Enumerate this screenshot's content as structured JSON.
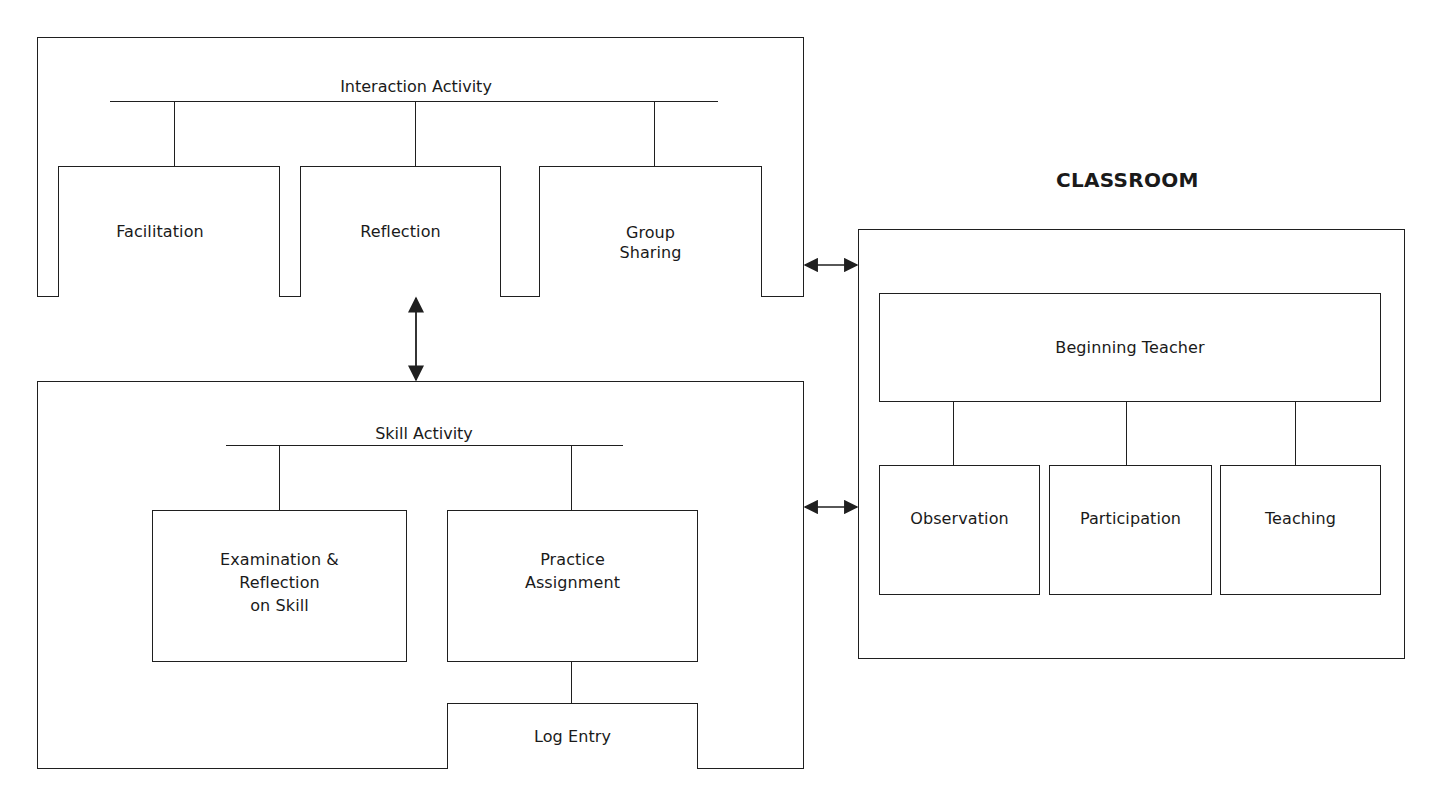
{
  "diagram": {
    "interaction_section": {
      "heading": "Interaction Activity",
      "children": [
        {
          "label": "Facilitation"
        },
        {
          "label": "Reflection"
        },
        {
          "label": "Group\nSharing"
        }
      ]
    },
    "skill_section": {
      "heading": "Skill Activity",
      "children": [
        {
          "label": "Examination &\nReflection\non Skill"
        },
        {
          "label": "Practice\nAssignment"
        }
      ],
      "sub_child": {
        "label": "Log Entry"
      }
    },
    "classroom_section": {
      "title": "CLASSROOM",
      "root": {
        "label": "Beginning Teacher"
      },
      "children": [
        {
          "label": "Observation"
        },
        {
          "label": "Participation"
        },
        {
          "label": "Teaching"
        }
      ]
    },
    "connections": [
      {
        "from": "Interaction Activity",
        "to": "Skill Activity",
        "type": "bidirectional"
      },
      {
        "from": "Interaction Activity",
        "to": "CLASSROOM",
        "type": "bidirectional"
      },
      {
        "from": "Skill Activity",
        "to": "CLASSROOM",
        "type": "bidirectional"
      }
    ],
    "line_color": "#1f1f1f",
    "background": "#ffffff"
  }
}
